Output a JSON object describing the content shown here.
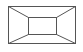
{
  "diagram": {
    "type": "room-perspective-wireframe",
    "stroke_color": "#555555",
    "background": "#ffffff",
    "outer_rect": {
      "x": 8,
      "y": 6,
      "w": 67,
      "h": 37
    },
    "inner_rect": {
      "x": 28,
      "y": 17,
      "w": 28,
      "h": 17
    }
  }
}
